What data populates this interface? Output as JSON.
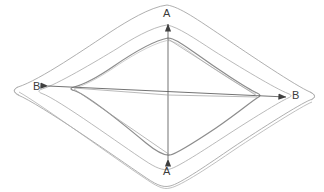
{
  "figure": {
    "background_color": "#ffffff",
    "line_color": "#9a9a9a",
    "inner_line_color": "#8a8a8a",
    "arrow_color": "#4a4a4a",
    "text_color": "#3b3b3b",
    "width": 324,
    "height": 192
  },
  "labels": {
    "section_a_top": "A",
    "section_a_bottom": "A",
    "section_b_left": "B",
    "section_b_right": "B"
  },
  "geometry": {
    "outer_rim": {
      "name": "outer-rim-contour",
      "top_apex": [
        167,
        5
      ],
      "left_corner": [
        16,
        88
      ],
      "bottom_apex": [
        170,
        186
      ],
      "right_corner": [
        312,
        100
      ]
    },
    "middle_rim": {
      "name": "middle-rim-contour",
      "top_apex": [
        167,
        26
      ],
      "left_corner": [
        40,
        90
      ],
      "bottom_apex": [
        170,
        168
      ],
      "right_corner": [
        289,
        99
      ]
    },
    "inner_cavity": {
      "name": "inner-cavity-contour",
      "top_apex": [
        168,
        38
      ],
      "left_corner": [
        73,
        88
      ],
      "bottom_apex": [
        170,
        155
      ],
      "right_corner": [
        257,
        97
      ]
    },
    "center_point": [
      168,
      95
    ],
    "section_line_a": {
      "name": "section-line-a-a",
      "orientation": "vertical",
      "from": [
        168,
        160
      ],
      "to": [
        168,
        22
      ]
    },
    "section_line_b": {
      "name": "section-line-b-b",
      "orientation": "horizontal",
      "from": [
        46,
        86
      ],
      "to": [
        288,
        97
      ]
    }
  }
}
